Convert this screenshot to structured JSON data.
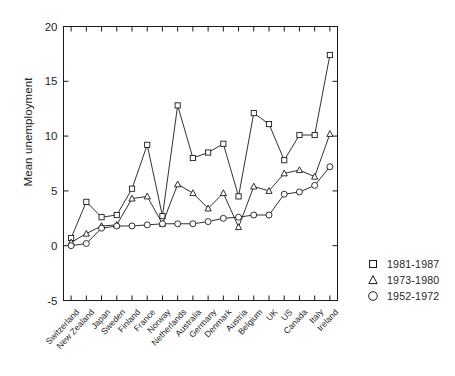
{
  "chart_data": {
    "type": "line",
    "title": "",
    "xlabel": "",
    "ylabel": "Mean unemployment",
    "ylim": [
      -5,
      20
    ],
    "yticks": [
      -5,
      0,
      5,
      10,
      15,
      20
    ],
    "ytick_labels": [
      "-5",
      "0",
      "5",
      "10",
      "15",
      "20"
    ],
    "grid": false,
    "legend_position": "right",
    "marker_style": [
      "square",
      "triangle",
      "circle"
    ],
    "categories": [
      "Switzerland",
      "New Zealand",
      "Japan",
      "Sweden",
      "Finland",
      "France",
      "Norway",
      "Netherlands",
      "Australia",
      "Germany",
      "Denmark",
      "Austria",
      "Belgium",
      "UK",
      "US",
      "Canada",
      "Italy",
      "Ireland"
    ],
    "series": [
      {
        "name": "1981-1987",
        "marker": "square",
        "values": [
          0.7,
          4.0,
          2.6,
          2.8,
          5.2,
          9.2,
          2.7,
          12.8,
          8.0,
          8.5,
          9.3,
          4.5,
          12.1,
          11.1,
          7.8,
          10.1,
          10.1,
          17.4
        ]
      },
      {
        "name": "1973-1980",
        "marker": "triangle",
        "values": [
          0.3,
          1.1,
          1.8,
          1.9,
          4.3,
          4.5,
          2.0,
          5.6,
          4.8,
          3.4,
          4.8,
          1.7,
          5.4,
          5.0,
          6.6,
          6.9,
          6.3,
          10.2
        ]
      },
      {
        "name": "1952-1972",
        "marker": "circle",
        "values": [
          0.0,
          0.2,
          1.6,
          1.8,
          1.8,
          1.9,
          2.0,
          2.0,
          2.0,
          2.2,
          2.5,
          2.6,
          2.8,
          2.8,
          4.7,
          4.9,
          5.5,
          7.2
        ]
      }
    ]
  },
  "axis": {
    "y_label": "Mean unemployment"
  },
  "legend": {
    "entries": [
      {
        "label": "1981-1987",
        "marker": "square"
      },
      {
        "label": "1973-1980",
        "marker": "triangle"
      },
      {
        "label": "1952-1972",
        "marker": "circle"
      }
    ]
  },
  "caption": "",
  "colors": {
    "line": "#1a1a1a",
    "axis": "#1a1a1a",
    "background": "#ffffff",
    "text": "#1f1f1f"
  }
}
